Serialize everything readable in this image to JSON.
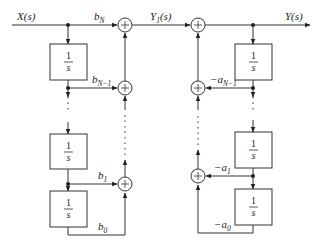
{
  "diagram": {
    "type": "block-diagram",
    "input_label": "X(s)",
    "intermediate_label": "Y₁(s)",
    "output_label": "Y(s)",
    "integrator_label": {
      "num": "1",
      "den": "s"
    },
    "feedforward_gains": [
      {
        "id": "bN",
        "base": "b",
        "sub": "N"
      },
      {
        "id": "bN-1",
        "base": "b",
        "sub": "N−1"
      },
      {
        "id": "b1",
        "base": "b",
        "sub": "1"
      },
      {
        "id": "b0",
        "base": "b",
        "sub": "0"
      }
    ],
    "feedback_gains": [
      {
        "id": "aN-1",
        "base": "−a",
        "sub": "N−1"
      },
      {
        "id": "a1",
        "base": "−a",
        "sub": "1"
      },
      {
        "id": "a0",
        "base": "−a",
        "sub": "0"
      }
    ],
    "adder_symbol": "+",
    "ellipsis": "⋮"
  }
}
